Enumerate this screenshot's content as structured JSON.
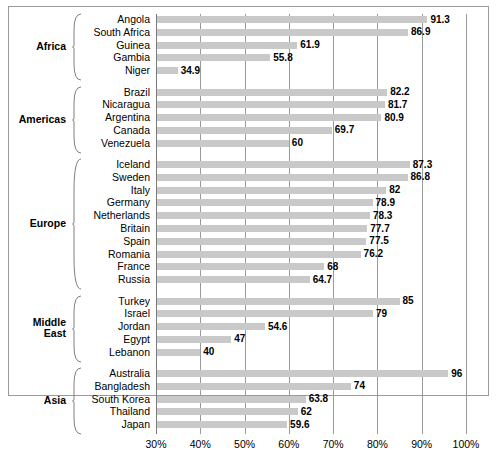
{
  "chart_data": {
    "type": "bar",
    "orientation": "horizontal",
    "title": "",
    "subtitle": "",
    "xlabel": "",
    "ylabel": "",
    "xlim": [
      30,
      100
    ],
    "xticks": [
      30,
      40,
      50,
      60,
      70,
      80,
      90,
      100
    ],
    "xtick_labels": [
      "30%",
      "40%",
      "50%",
      "60%",
      "70%",
      "80%",
      "90%",
      "100%"
    ],
    "grid": true,
    "legend": "none",
    "value_suffix": "",
    "bar_color": "#c9c9c9",
    "groups": [
      {
        "name": "Africa",
        "categories": [
          "Angola",
          "South Africa",
          "Guinea",
          "Gambia",
          "Niger"
        ],
        "values": [
          91.3,
          86.9,
          61.9,
          55.8,
          34.9
        ],
        "value_labels": [
          "91.3",
          "86.9",
          "61.9",
          "55.8",
          "34.9"
        ]
      },
      {
        "name": "Americas",
        "categories": [
          "Brazil",
          "Nicaragua",
          "Argentina",
          "Canada",
          "Venezuela"
        ],
        "values": [
          82.2,
          81.7,
          80.9,
          69.7,
          60
        ],
        "value_labels": [
          "82.2",
          "81.7",
          "80.9",
          "69.7",
          "60"
        ]
      },
      {
        "name": "Europe",
        "categories": [
          "Iceland",
          "Sweden",
          "Italy",
          "Germany",
          "Netherlands",
          "Britain",
          "Spain",
          "Romania",
          "France",
          "Russia"
        ],
        "values": [
          87.3,
          86.8,
          82,
          78.9,
          78.3,
          77.7,
          77.5,
          76.2,
          68,
          64.7
        ],
        "value_labels": [
          "87.3",
          "86.8",
          "82",
          "78.9",
          "78.3",
          "77.7",
          "77.5",
          "76.2",
          "68",
          "64.7"
        ]
      },
      {
        "name": "Middle East",
        "categories": [
          "Turkey",
          "Israel",
          "Jordan",
          "Egypt",
          "Lebanon"
        ],
        "values": [
          85,
          79,
          54.6,
          47,
          40
        ],
        "value_labels": [
          "85",
          "79",
          "54.6",
          "47",
          "40"
        ]
      },
      {
        "name": "Asia",
        "categories": [
          "Australia",
          "Bangladesh",
          "South Korea",
          "Thailand",
          "Japan"
        ],
        "values": [
          96,
          74,
          63.8,
          62,
          59.6
        ],
        "value_labels": [
          "96",
          "74",
          "63.8",
          "62",
          "59.6"
        ]
      }
    ]
  }
}
